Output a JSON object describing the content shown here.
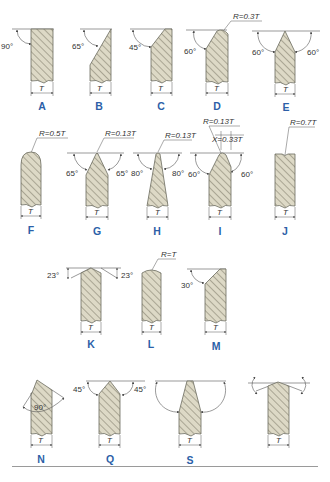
{
  "figure": {
    "dimension_symbol": "T",
    "colors": {
      "label": "#2c5fa8",
      "fill": "#ddd9c6",
      "hatch": "#7d7a68",
      "line": "#555555"
    }
  },
  "profiles": [
    {
      "id": "A",
      "label": "A",
      "angles": [
        "90°"
      ],
      "annotations": []
    },
    {
      "id": "B",
      "label": "B",
      "angles": [
        "65°"
      ],
      "annotations": []
    },
    {
      "id": "C",
      "label": "C",
      "angles": [
        "45°"
      ],
      "annotations": []
    },
    {
      "id": "D",
      "label": "D",
      "angles": [
        "60°"
      ],
      "annotations": [
        "R=0.3T"
      ]
    },
    {
      "id": "E",
      "label": "E",
      "angles": [
        "60°",
        "60°"
      ],
      "annotations": []
    },
    {
      "id": "F",
      "label": "F",
      "angles": [],
      "annotations": [
        "R=0.5T"
      ]
    },
    {
      "id": "G",
      "label": "G",
      "angles": [
        "65°",
        "65°"
      ],
      "annotations": [
        "R=0.13T"
      ]
    },
    {
      "id": "H",
      "label": "H",
      "angles": [
        "80°",
        "80°"
      ],
      "annotations": [
        "R=0.13T"
      ]
    },
    {
      "id": "I",
      "label": "I",
      "angles": [
        "60°",
        "60°"
      ],
      "annotations": [
        "R=0.13T",
        "X=0.33T"
      ]
    },
    {
      "id": "J",
      "label": "J",
      "angles": [],
      "annotations": [
        "R=0.7T"
      ]
    },
    {
      "id": "K",
      "label": "K",
      "angles": [
        "23°",
        "23°"
      ],
      "annotations": []
    },
    {
      "id": "L",
      "label": "L",
      "angles": [],
      "annotations": [
        "R=T"
      ]
    },
    {
      "id": "M",
      "label": "M",
      "angles": [
        "30°"
      ],
      "annotations": []
    },
    {
      "id": "N",
      "label": "N",
      "angles": [
        "90°"
      ],
      "annotations": []
    },
    {
      "id": "P",
      "label": "P",
      "angles": [
        "45°",
        "45°"
      ],
      "annotations": []
    },
    {
      "id": "Q",
      "label": "Q",
      "angles": [
        "70°",
        "70°"
      ],
      "annotations": []
    },
    {
      "id": "S",
      "label": "S",
      "angles": [],
      "annotations": []
    }
  ]
}
